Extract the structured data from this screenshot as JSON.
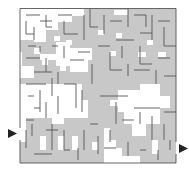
{
  "puzzle": {
    "type": "maze",
    "grid_cols": 25,
    "grid_rows": 25,
    "entrance": {
      "side": "left",
      "label": "entrance-arrow"
    },
    "exit": {
      "side": "right",
      "label": "exit-arrow"
    },
    "colors": {
      "background": "#ffffff",
      "wall": "#555555",
      "solution_shading": "#c8c8c8",
      "arrow": "#222222"
    }
  }
}
